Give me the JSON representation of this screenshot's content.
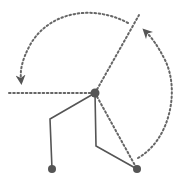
{
  "diagram": {
    "type": "rotation-angle-diagram",
    "colors": {
      "line": "#555555",
      "dot": "#555555",
      "dotted": "#666666",
      "background": "#ffffff"
    },
    "pivot": {
      "x": 95,
      "y": 93,
      "r": 4.5
    },
    "reference_lines": [
      {
        "name": "horizontal-reference-line",
        "x1": 9,
        "y1": 93,
        "x2": 95,
        "y2": 93
      },
      {
        "name": "upper-right-reference-line",
        "x1": 95,
        "y1": 93,
        "x2": 139,
        "y2": 15
      },
      {
        "name": "lower-right-reference-line",
        "x1": 95,
        "y1": 93,
        "x2": 137,
        "y2": 169
      }
    ],
    "arms": [
      {
        "name": "left-arm",
        "points": [
          [
            95,
            93
          ],
          [
            50,
            119
          ],
          [
            52,
            169
          ]
        ],
        "end_dot": {
          "x": 52,
          "y": 169,
          "r": 4
        }
      },
      {
        "name": "right-arm",
        "points": [
          [
            95,
            93
          ],
          [
            96,
            146
          ],
          [
            137,
            169
          ]
        ],
        "end_dot": {
          "x": 137,
          "y": 169,
          "r": 4
        }
      }
    ],
    "arcs": [
      {
        "name": "large-rotation-arc",
        "path": "M 128 23 C 95 5, 50 10, 30 45 C 22 60, 20 70, 21 80",
        "arrow_at": "end"
      },
      {
        "name": "small-rotation-arc",
        "path": "M 138 158 C 170 140, 180 90, 165 60 C 158 46, 152 38, 146 32",
        "arrow_at": "end"
      }
    ]
  }
}
